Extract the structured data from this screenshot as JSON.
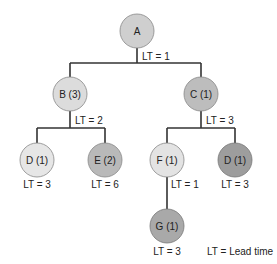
{
  "diagram": {
    "type": "product-structure-tree",
    "nodes": [
      {
        "id": "A",
        "label": "A",
        "fill": "#cfcfcf",
        "cx": 137,
        "cy": 31
      },
      {
        "id": "B",
        "label": "B (3)",
        "fill": "#dcdcdc",
        "cx": 70,
        "cy": 94
      },
      {
        "id": "C",
        "label": "C (1)",
        "fill": "#bdbdbd",
        "cx": 201,
        "cy": 94
      },
      {
        "id": "D1",
        "label": "D (1)",
        "fill": "#e6e6e6",
        "cx": 37,
        "cy": 160
      },
      {
        "id": "E",
        "label": "E (2)",
        "fill": "#b9b9b9",
        "cx": 105,
        "cy": 160
      },
      {
        "id": "F",
        "label": "F (1)",
        "fill": "#e3e3e3",
        "cx": 167,
        "cy": 160
      },
      {
        "id": "D2",
        "label": "D (1)",
        "fill": "#9d9d9d",
        "cx": 235,
        "cy": 160
      },
      {
        "id": "G",
        "label": "G (1)",
        "fill": "#a9a9a9",
        "cx": 167,
        "cy": 226
      }
    ],
    "edges": [
      {
        "from": "A",
        "to": "B"
      },
      {
        "from": "A",
        "to": "C"
      },
      {
        "from": "B",
        "to": "D1"
      },
      {
        "from": "B",
        "to": "E"
      },
      {
        "from": "C",
        "to": "F"
      },
      {
        "from": "C",
        "to": "D2"
      },
      {
        "from": "F",
        "to": "G"
      }
    ],
    "lead_times": {
      "A": "LT = 1",
      "B": "LT = 2",
      "C": "LT = 3",
      "D1": "LT = 3",
      "E": "LT = 6",
      "F": "LT = 1",
      "D2": "LT = 3",
      "G": "LT = 3"
    },
    "legend": "LT = Lead time"
  }
}
